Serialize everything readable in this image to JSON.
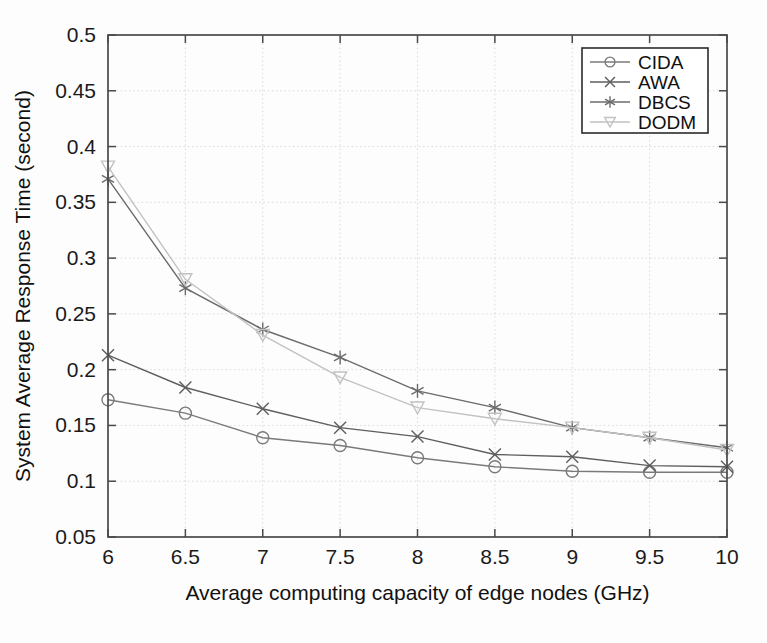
{
  "chart_data": {
    "type": "line",
    "title": "",
    "xlabel": "Average computing capacity of edge nodes (GHz)",
    "ylabel": "System Average Response Time (second)",
    "x": [
      6,
      6.5,
      7,
      7.5,
      8,
      8.5,
      9,
      9.5,
      10
    ],
    "xtick_labels": [
      "6",
      "6.5",
      "7",
      "7.5",
      "8",
      "8.5",
      "9",
      "9.5",
      "10"
    ],
    "ytick_labels": [
      "0.05",
      "0.1",
      "0.15",
      "0.2",
      "0.25",
      "0.3",
      "0.35",
      "0.4",
      "0.45",
      "0.5"
    ],
    "ytick_values": [
      0.05,
      0.1,
      0.15,
      0.2,
      0.25,
      0.3,
      0.35,
      0.4,
      0.45,
      0.5
    ],
    "xlim": [
      6,
      10
    ],
    "ylim": [
      0.05,
      0.5
    ],
    "grid": true,
    "legend_position": "upper right",
    "series": [
      {
        "name": "CIDA",
        "marker": "circle",
        "color": "#7a7a7a",
        "values": [
          0.173,
          0.161,
          0.139,
          0.132,
          0.121,
          0.113,
          0.109,
          0.108,
          0.108
        ]
      },
      {
        "name": "AWA",
        "marker": "x",
        "color": "#5e5e5e",
        "values": [
          0.213,
          0.184,
          0.165,
          0.148,
          0.14,
          0.124,
          0.122,
          0.114,
          0.113
        ]
      },
      {
        "name": "DBCS",
        "marker": "asterisk",
        "color": "#6b6b6b",
        "values": [
          0.371,
          0.273,
          0.236,
          0.211,
          0.181,
          0.166,
          0.148,
          0.139,
          0.13
        ]
      },
      {
        "name": "DODM",
        "marker": "triangle-down",
        "color": "#c2c2c2",
        "values": [
          0.382,
          0.281,
          0.231,
          0.193,
          0.166,
          0.156,
          0.148,
          0.139,
          0.128
        ]
      }
    ]
  },
  "legend": {
    "entries": [
      "CIDA",
      "AWA",
      "DBCS",
      "DODM"
    ]
  },
  "colors": {
    "axis": "#4a4a4a",
    "grid": "#d8d8d8",
    "background": "#fdfdfd",
    "text": "#1a1a1a"
  }
}
